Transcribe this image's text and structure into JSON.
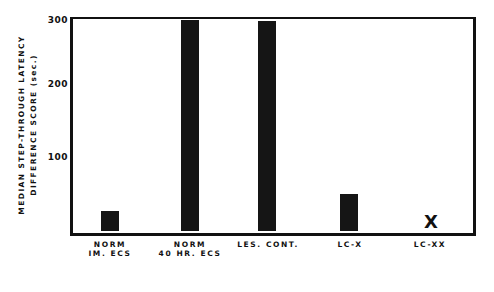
{
  "chart_data": {
    "type": "bar",
    "title": "",
    "xlabel": "",
    "ylabel": "MEDIAN STEP-THROUGH LATENCY DIFFERENCE SCORE (sec.)",
    "ylabel_lines": [
      "MEDIAN STEP-THROUGH LATENCY",
      "DIFFERENCE SCORE (sec.)"
    ],
    "ylim": [
      0,
      300
    ],
    "yticks": [
      "100",
      "200",
      "300"
    ],
    "grid": false,
    "legend": null,
    "categories": [
      "NORM IM. ECS",
      "NORM 40 HR. ECS",
      "LES. CONT.",
      "LC-X",
      "LC-XX"
    ],
    "category_lines": [
      [
        "NORM",
        "IM. ECS"
      ],
      [
        "NORM",
        "40 HR. ECS"
      ],
      [
        "LES. CONT."
      ],
      [
        "LC-X"
      ],
      [
        "LC-XX"
      ]
    ],
    "values": [
      28,
      300,
      298,
      52,
      0
    ],
    "annotations": [
      {
        "category": "LC-XX",
        "marker": "X",
        "note": "no bar drawn; marked with X"
      }
    ]
  }
}
